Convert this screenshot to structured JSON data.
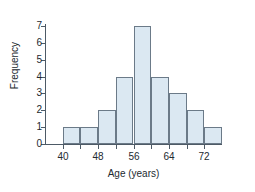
{
  "chart_data": {
    "type": "bar",
    "title": "",
    "subtitle": "",
    "xlabel": "Age (years)",
    "ylabel": "Frequency",
    "categories": [
      "40-44",
      "44-48",
      "48-52",
      "52-56",
      "56-60",
      "60-64",
      "64-68",
      "68-72",
      "72-76"
    ],
    "bin_edges": [
      40,
      44,
      48,
      52,
      56,
      60,
      64,
      68,
      72,
      76
    ],
    "bin_width": 4,
    "values": [
      1,
      1,
      2,
      4,
      7,
      4,
      3,
      2,
      1
    ],
    "xlim": [
      36,
      76
    ],
    "ylim": [
      0,
      7
    ],
    "x_tick_values": [
      40,
      44,
      48,
      52,
      56,
      60,
      64,
      68,
      72
    ],
    "x_tick_labels": [
      "40",
      "",
      "48",
      "",
      "56",
      "",
      "64",
      "",
      "72"
    ],
    "y_tick_values": [
      0,
      1,
      2,
      3,
      4,
      5,
      6,
      7
    ],
    "y_tick_labels": [
      "0",
      "1",
      "2",
      "3",
      "4",
      "5",
      "6",
      "7"
    ],
    "grid": false,
    "legend": null,
    "bar_fill_color": "#dbe8f2",
    "bar_border_color": "#6b7a88",
    "axis_color": "#4d5a66",
    "text_color": "#232a30",
    "background_color": "#ffffff"
  }
}
